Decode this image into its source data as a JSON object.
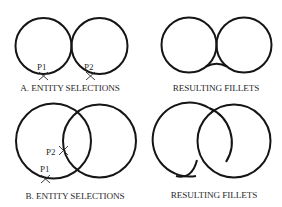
{
  "panels": {
    "a_selection": {
      "caption": "A. ENTITY SELECTIONS",
      "points": [
        {
          "label": "P1",
          "marker": "x-mark"
        },
        {
          "label": "P2",
          "marker": "x-mark"
        }
      ]
    },
    "a_result": {
      "caption": "RESULTING FILLETS"
    },
    "b_selection": {
      "caption": "B. ENTITY SELECTIONS",
      "points": [
        {
          "label": "P2",
          "marker": "x-mark"
        },
        {
          "label": "P1",
          "marker": "x-mark"
        }
      ]
    },
    "b_result": {
      "caption": "RESULTING FILLETS"
    }
  },
  "colors": {
    "line": "#151515",
    "text": "#2a2a2a",
    "background": "#ffffff"
  }
}
